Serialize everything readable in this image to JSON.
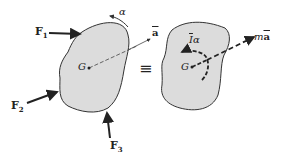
{
  "diagram": {
    "type": "rigid-body-kinetics",
    "left_body": {
      "center_label": "G",
      "forces": [
        {
          "label": "F",
          "subscript": "1"
        },
        {
          "label": "F",
          "subscript": "2"
        },
        {
          "label": "F",
          "subscript": "3"
        }
      ],
      "angular_accel_label": "α",
      "accel_label": "a"
    },
    "equivalence_symbol": "≡",
    "right_body": {
      "center_label": "G",
      "moment_label_I": "I",
      "moment_label_alpha": "α",
      "force_label_m": "m",
      "force_label_a": "a"
    },
    "colors": {
      "body_fill": "#dcdcdc",
      "stroke": "#333333"
    }
  }
}
